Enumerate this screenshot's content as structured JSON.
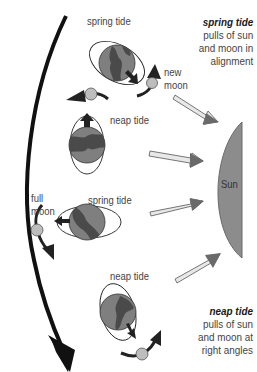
{
  "diagram": {
    "type": "tides-explanation",
    "colors": {
      "earth_ocean": "#7f7f7f",
      "earth_land": "#4a4a4a",
      "moon": "#bdbdbd",
      "sun": "#8c8c8c",
      "arrow_fill": "#6e6e6e",
      "orbit_arrow": "#222222",
      "ray_fill": "#e6e6e6",
      "text": "#444444"
    },
    "legend": {
      "spring": {
        "title": "spring tide",
        "lines": [
          "pulls of sun",
          "and moon in",
          "alignment"
        ]
      },
      "neap": {
        "title": "neap tide",
        "lines": [
          "pulls of sun",
          "and moon at",
          "right angles"
        ]
      }
    },
    "sun": {
      "label": "Sun"
    },
    "phases": [
      {
        "id": "phase-1",
        "tide_label": "spring tide",
        "moon_label": "new moon",
        "moon_label_lines": [
          "new",
          "moon"
        ]
      },
      {
        "id": "phase-2",
        "tide_label": "neap tide"
      },
      {
        "id": "phase-3",
        "tide_label": "spring tide",
        "moon_label": "full moon",
        "moon_label_lines": [
          "full",
          "moon"
        ]
      },
      {
        "id": "phase-4",
        "tide_label": "neap tide"
      }
    ]
  }
}
